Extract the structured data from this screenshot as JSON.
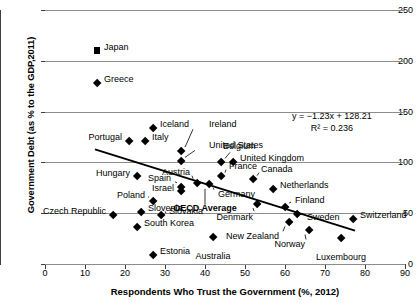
{
  "chart_data": {
    "type": "scatter",
    "title": "",
    "xlabel": "Respondents Who Trust the Government (%, 2012)",
    "ylabel": "Government Debt (as % to the GDP,2011)",
    "xlim": [
      0,
      90
    ],
    "ylim": [
      0,
      250
    ],
    "xticks": [
      0,
      10,
      20,
      30,
      40,
      50,
      60,
      70,
      80,
      90
    ],
    "yticks": [
      0,
      50,
      100,
      150,
      200,
      250
    ],
    "grid": "horizontal",
    "legend": "none",
    "annotations": {
      "equation": "y = −1.23x + 128.21",
      "r_squared": "R² = 0.236"
    },
    "trendline": {
      "slope": -1.23,
      "intercept": 128.21,
      "x_start": 12.5,
      "x_end": 77.5
    },
    "points": [
      {
        "label": "Japan",
        "x": 13,
        "y": 210,
        "marker": "square",
        "label_pos": "right"
      },
      {
        "label": "Greece",
        "x": 13,
        "y": 178,
        "marker": "diamond",
        "label_pos": "right"
      },
      {
        "label": "Iceland",
        "x": 27,
        "y": 134,
        "marker": "diamond",
        "label_pos": "right"
      },
      {
        "label": "Portugal",
        "x": 21,
        "y": 121,
        "marker": "diamond",
        "label_pos": "left"
      },
      {
        "label": "Italy",
        "x": 25,
        "y": 121,
        "marker": "diamond",
        "label_pos": "right"
      },
      {
        "label": "Ireland",
        "x": 34,
        "y": 111,
        "marker": "diamond",
        "label_pos": "leader"
      },
      {
        "label": "United States",
        "x": 34,
        "y": 101,
        "marker": "diamond",
        "label_pos": "leader"
      },
      {
        "label": "Belgium",
        "x": 44,
        "y": 100,
        "marker": "diamond",
        "label_pos": "leader"
      },
      {
        "label": "United Kingdom",
        "x": 47,
        "y": 100,
        "marker": "diamond",
        "label_pos": "right"
      },
      {
        "label": "Austria",
        "x": 38,
        "y": 80,
        "marker": "diamond",
        "label_pos": "leader"
      },
      {
        "label": "France",
        "x": 44,
        "y": 86,
        "marker": "diamond",
        "label_pos": "leader"
      },
      {
        "label": "Canada",
        "x": 52,
        "y": 83,
        "marker": "diamond",
        "label_pos": "leader"
      },
      {
        "label": "Hungary",
        "x": 23,
        "y": 86,
        "marker": "diamond",
        "label_pos": "left"
      },
      {
        "label": "Spain",
        "x": 34,
        "y": 76,
        "marker": "diamond",
        "label_pos": "leader"
      },
      {
        "label": "Israel",
        "x": 34,
        "y": 72,
        "marker": "diamond",
        "label_pos": "left"
      },
      {
        "label": "Germany",
        "x": 41,
        "y": 79,
        "marker": "diamond",
        "label_pos": "leader"
      },
      {
        "label": "Netherlands",
        "x": 57,
        "y": 74,
        "marker": "diamond",
        "label_pos": "right"
      },
      {
        "label": "Poland",
        "x": 27,
        "y": 62,
        "marker": "diamond",
        "label_pos": "left"
      },
      {
        "label": "OECD Average",
        "x": 40,
        "y": 78,
        "marker": "none",
        "label_pos": "leader"
      },
      {
        "label": "Czech Republic",
        "x": 17,
        "y": 48,
        "marker": "diamond",
        "label_pos": "left"
      },
      {
        "label": "Slovenia",
        "x": 24,
        "y": 51,
        "marker": "diamond",
        "label_pos": "right"
      },
      {
        "label": "Slovakia",
        "x": 29,
        "y": 48,
        "marker": "diamond",
        "label_pos": "right"
      },
      {
        "label": "Denmark",
        "x": 53,
        "y": 59,
        "marker": "diamond",
        "label_pos": "leader"
      },
      {
        "label": "Finland",
        "x": 60,
        "y": 56,
        "marker": "diamond",
        "label_pos": "leader"
      },
      {
        "label": "Sweden",
        "x": 63,
        "y": 49,
        "marker": "diamond",
        "label_pos": "leader"
      },
      {
        "label": "Switzerland",
        "x": 77,
        "y": 44,
        "marker": "diamond",
        "label_pos": "right"
      },
      {
        "label": "South Korea",
        "x": 23,
        "y": 36,
        "marker": "diamond",
        "label_pos": "right"
      },
      {
        "label": "New Zealand",
        "x": 61,
        "y": 41,
        "marker": "diamond",
        "label_pos": "leader"
      },
      {
        "label": "Norway",
        "x": 66,
        "y": 33,
        "marker": "diamond",
        "label_pos": "leader"
      },
      {
        "label": "Australia",
        "x": 42,
        "y": 26,
        "marker": "diamond",
        "label_pos": "below"
      },
      {
        "label": "Luxembourg",
        "x": 74,
        "y": 25,
        "marker": "diamond",
        "label_pos": "below"
      },
      {
        "label": "Estonia",
        "x": 27,
        "y": 9,
        "marker": "diamond",
        "label_pos": "right"
      }
    ]
  },
  "axis": {
    "y_title": "Government Debt (as % to the GDP,2011)",
    "x_title": "Respondents Who Trust the Government (%, 2012)",
    "y_tick_labels": [
      "250",
      "200",
      "150",
      "100",
      "50",
      "0"
    ],
    "x_tick_labels": [
      "0",
      "10",
      "20",
      "30",
      "40",
      "50",
      "60",
      "70",
      "80",
      "90"
    ]
  },
  "equation": {
    "line1": "y = −1.23x + 128.21",
    "line2": "R² = 0.236"
  },
  "colors": {
    "marker": "#000000",
    "trendline": "#000000",
    "gridline": "#8c8c8c",
    "axis": "#3f3f3f",
    "background": "#ffffff"
  }
}
